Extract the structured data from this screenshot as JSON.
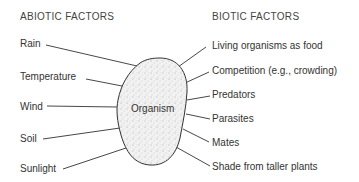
{
  "diagram": {
    "center_label": "Organism",
    "abiotic": {
      "title": "ABIOTIC FACTORS",
      "items": [
        "Rain",
        "Temperature",
        "Wind",
        "Soil",
        "Sunlight"
      ]
    },
    "biotic": {
      "title": "BIOTIC FACTORS",
      "items": [
        "Living organisms as food",
        "Competition (e.g., crowding)",
        "Predators",
        "Parasites",
        "Mates",
        "Shade from taller plants"
      ]
    },
    "colors": {
      "line": "#333333",
      "fill": "#eeeeee",
      "text": "#333333"
    }
  }
}
